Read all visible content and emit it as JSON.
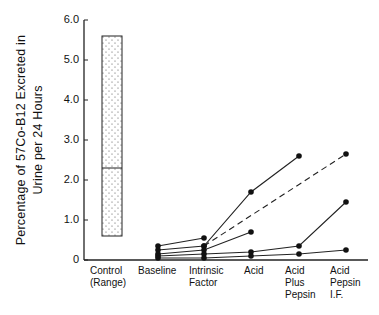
{
  "chart_data": {
    "type": "line",
    "title": "",
    "ylabel_line1": "Percentage of 57Co-B12 Excreted in",
    "ylabel_line2": "Urine per 24 Hours",
    "xlabel": "",
    "ylim": [
      0,
      6.0
    ],
    "yticks": [
      "0",
      "1.0",
      "2.0",
      "3.0",
      "4.0",
      "5.0",
      "6.0"
    ],
    "categories": [
      "Control (Range)",
      "Baseline",
      "Intrinsic Factor",
      "Acid",
      "Acid Plus Pepsin",
      "Acid Pepsin I.F."
    ],
    "category_labels": [
      [
        "Control",
        "(Range)"
      ],
      [
        "Baseline"
      ],
      [
        "Intrinsic",
        "Factor"
      ],
      [
        "Acid"
      ],
      [
        "Acid",
        "Plus",
        "Pepsin"
      ],
      [
        "Acid",
        "Pepsin",
        "I.F."
      ]
    ],
    "control_range": {
      "min": 0.6,
      "max": 5.6,
      "median": 2.3
    },
    "series": [
      {
        "name": "patient-1",
        "style": "solid",
        "values": [
          null,
          0.35,
          0.55,
          null,
          null,
          null
        ]
      },
      {
        "name": "patient-2",
        "style": "solid",
        "values": [
          null,
          0.25,
          0.35,
          1.7,
          2.6,
          null
        ]
      },
      {
        "name": "patient-2-dashed",
        "style": "dashed",
        "values": [
          null,
          null,
          0.35,
          null,
          null,
          2.65
        ]
      },
      {
        "name": "patient-3",
        "style": "solid",
        "values": [
          null,
          0.15,
          0.25,
          0.7,
          null,
          null
        ]
      },
      {
        "name": "patient-4",
        "style": "solid",
        "values": [
          null,
          0.1,
          0.15,
          0.2,
          0.35,
          1.45
        ]
      },
      {
        "name": "patient-5",
        "style": "solid",
        "values": [
          null,
          0.05,
          0.05,
          0.1,
          0.15,
          0.25
        ]
      }
    ],
    "grid": false,
    "legend": "none"
  }
}
